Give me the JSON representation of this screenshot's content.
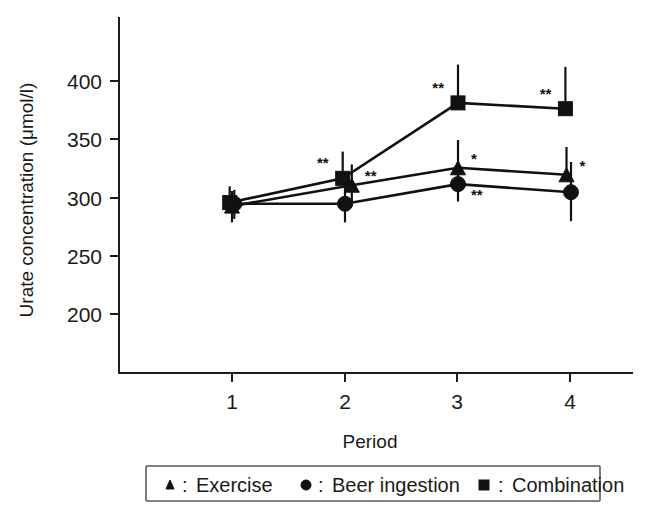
{
  "chart_data": {
    "type": "line",
    "title": "",
    "xlabel": "Period",
    "ylabel": "Urate concentration (μmol/l)",
    "x": [
      1,
      2,
      3,
      4
    ],
    "xtick_labels": [
      "1",
      "2",
      "3",
      "4"
    ],
    "ytick_labels": [
      "200",
      "250",
      "300",
      "350",
      "400"
    ],
    "ytick_values": [
      200,
      250,
      300,
      350,
      400
    ],
    "ylim": [
      175,
      430
    ],
    "xlim": [
      0.55,
      4.45
    ],
    "grid": false,
    "legend_position": "below-axes",
    "series": [
      {
        "name": "Exercise",
        "marker": "triangle",
        "values": [
          293,
          311,
          326,
          320
        ],
        "err_up": [
          13,
          18,
          24,
          24
        ],
        "err_down": [
          14,
          18,
          16,
          0
        ],
        "x_offset": [
          0.0,
          0.06,
          0.0,
          -0.04
        ],
        "annotations": [
          "",
          "**",
          "*",
          "*"
        ]
      },
      {
        "name": "Beer ingestion",
        "marker": "circle",
        "values": [
          295,
          295,
          312,
          305
        ],
        "err_up": [
          12,
          15,
          15,
          26
        ],
        "err_down": [
          13,
          16,
          15,
          25
        ],
        "x_offset": [
          0.02,
          0.0,
          0.0,
          0.0
        ],
        "annotations": [
          "",
          "",
          "**",
          ""
        ]
      },
      {
        "name": "Combination",
        "marker": "square",
        "values": [
          296,
          317,
          382,
          377
        ],
        "err_up": [
          14,
          23,
          33,
          36
        ],
        "err_down": [
          0,
          0,
          0,
          0
        ],
        "x_offset": [
          -0.02,
          -0.02,
          0.0,
          -0.05
        ],
        "annotations": [
          "",
          "**",
          "**",
          "**"
        ]
      }
    ]
  },
  "legend": {
    "items": [
      {
        "marker": "triangle",
        "separator": ":",
        "label": "Exercise"
      },
      {
        "marker": "circle",
        "separator": ":",
        "label": "Beer ingestion"
      },
      {
        "marker": "square",
        "separator": ":",
        "label": "Combination"
      }
    ]
  },
  "colors": {
    "ink": "#111111",
    "axis": "#1c1c1c",
    "background": "#ffffff",
    "legend_border": "#5a5a5a"
  }
}
